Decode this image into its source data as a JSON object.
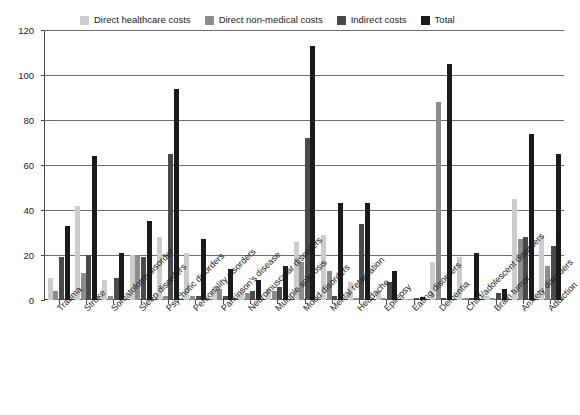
{
  "chart_data": {
    "type": "bar",
    "title": "",
    "subtitle": "",
    "xlabel": "",
    "ylabel": "",
    "ylim": [
      0,
      120
    ],
    "yticks": [
      0,
      20,
      40,
      60,
      80,
      100,
      120
    ],
    "grid": true,
    "legend_position": "top",
    "categories": [
      "Trauma",
      "Stroke",
      "Somatoform disorder",
      "Sleep disorders",
      "Psychotic disorders",
      "Personality disorders",
      "Parkinson's disease",
      "Neuromuscular disorders",
      "Multiple sclerosis",
      "Mood disorders",
      "Mental retardation",
      "Headache",
      "Epilepsy",
      "Eating disorders",
      "Dementia",
      "Child/adolescent disorders",
      "Brain tumor",
      "Anxiety disorders",
      "Addiction"
    ],
    "series": [
      {
        "name": "Direct healthcare costs",
        "color": "#cccccc",
        "values": [
          10,
          42,
          9,
          20,
          28,
          21,
          6,
          4,
          5,
          26,
          29,
          8,
          4,
          0.5,
          17,
          19,
          2,
          45,
          28
        ]
      },
      {
        "name": "Direct non-medical costs",
        "color": "#8c8c8c",
        "values": [
          4,
          12,
          2,
          20,
          2,
          2,
          5,
          3,
          4,
          17,
          13,
          1,
          1,
          0.3,
          88,
          1,
          1,
          27,
          15
        ]
      },
      {
        "name": "Indirect costs",
        "color": "#4a4a4a",
        "values": [
          19,
          20,
          10,
          19,
          65,
          2,
          2,
          4,
          6,
          72,
          2,
          34,
          8,
          1,
          1,
          1,
          3,
          28,
          24
        ]
      },
      {
        "name": "Total",
        "color": "#1a1a1a",
        "values": [
          33,
          64,
          21,
          35,
          94,
          27,
          14,
          9,
          15,
          113,
          43,
          43,
          13,
          1.5,
          105,
          21,
          5,
          74,
          65
        ]
      }
    ]
  },
  "axis": {
    "y_tick_labels": [
      "0",
      "20",
      "40",
      "60",
      "80",
      "100",
      "120"
    ]
  }
}
